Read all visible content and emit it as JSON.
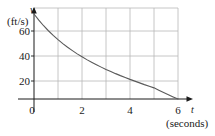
{
  "chart_data": {
    "type": "line",
    "title": "",
    "subtitle": "",
    "xlabel": "t",
    "xunit": "(seconds)",
    "ylabel": "v",
    "yunit": "(ft/s)",
    "xlim": [
      0,
      6.6
    ],
    "ylim": [
      0,
      78
    ],
    "grid": true,
    "legend": null,
    "x_ticks": [
      {
        "value": 0,
        "label": "0"
      },
      {
        "value": 2,
        "label": "2"
      },
      {
        "value": 4,
        "label": "4"
      },
      {
        "value": 6,
        "label": "6"
      }
    ],
    "y_ticks": [
      {
        "value": 20,
        "label": "20"
      },
      {
        "value": 40,
        "label": "40"
      },
      {
        "value": 60,
        "label": "60"
      }
    ],
    "x_gridlines": [
      0,
      1,
      2,
      3,
      4,
      5,
      6
    ],
    "y_gridlines": [
      0,
      20,
      40,
      60,
      78
    ],
    "series": [
      {
        "name": "velocity",
        "color": "#5a5a5a",
        "x": [
          0.0,
          0.2,
          0.4,
          0.6,
          0.8,
          1.0,
          1.2,
          1.4,
          1.6,
          1.8,
          2.0,
          2.2,
          2.4,
          2.6,
          2.8,
          3.0,
          3.2,
          3.4,
          3.6,
          3.8,
          4.0,
          4.2,
          4.4,
          4.6,
          4.8,
          5.0,
          5.2,
          5.4,
          5.6,
          5.8,
          6.0
        ],
        "y": [
          68.0,
          63.1,
          58.6,
          54.6,
          50.9,
          47.5,
          44.3,
          41.4,
          38.7,
          36.1,
          33.8,
          31.5,
          29.4,
          27.4,
          25.5,
          23.7,
          22.0,
          20.3,
          18.7,
          17.2,
          15.7,
          14.3,
          12.9,
          11.5,
          10.2,
          8.9,
          7.0,
          5.2,
          3.4,
          1.7,
          0.0
        ]
      }
    ],
    "axis_color": "#1a1a1a",
    "grid_color": "#b8b8b8",
    "curve_color": "#5a5a5a",
    "background": "#ffffff"
  },
  "axes": {
    "y_variable": "v",
    "y_units": "(ft/s)",
    "x_variable": "t",
    "x_units": "(seconds)"
  },
  "ticks": {
    "y": [
      "60",
      "40",
      "20"
    ],
    "x": [
      "0",
      "2",
      "4",
      "6"
    ]
  }
}
